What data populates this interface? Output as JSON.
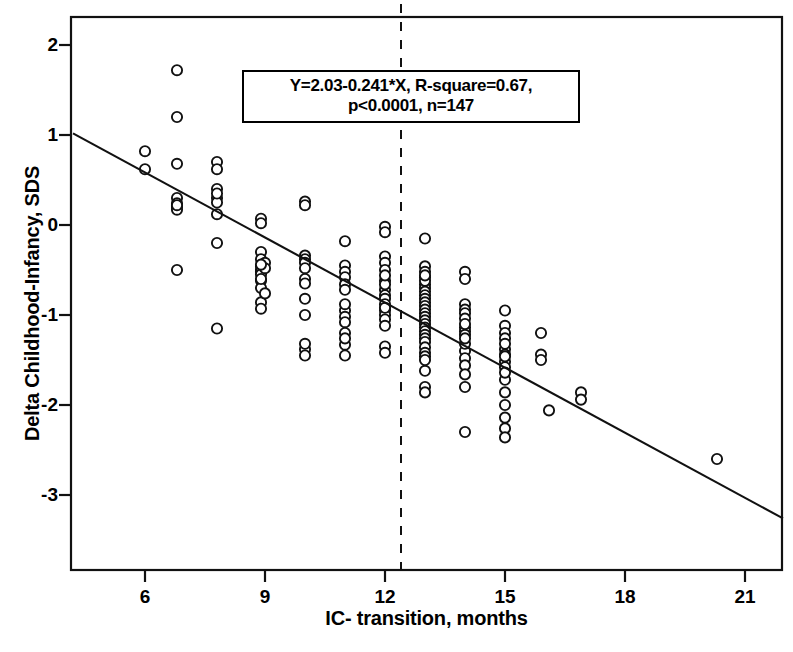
{
  "chart_data": {
    "type": "scatter",
    "title": "",
    "xlabel": "IC- transition, months",
    "ylabel": "Delta Childhood-Infancy, SDS",
    "xlim": [
      4.2,
      21.95
    ],
    "ylim": [
      -3.3,
      2.3
    ],
    "xticks": [
      6,
      9,
      12,
      15,
      18,
      21
    ],
    "yticks": [
      2,
      1,
      0,
      -1,
      -2,
      -3
    ],
    "grid": false,
    "legend": null,
    "marker": "open-circle",
    "annotation": {
      "line1": "Y=2.03-0.241*X,  R-square=0.67,",
      "line2": "p<0.0001, n=147"
    },
    "fit": {
      "equation": "Y=2.03-0.241*X",
      "slope": -0.241,
      "intercept": 2.03,
      "r_square": 0.67,
      "p_value": "p<0.0001",
      "n": 147,
      "x_start": 4.2,
      "x_end": 21.95
    },
    "vline": {
      "x": 12.4,
      "style": "dashed"
    },
    "points": [
      [
        6.0,
        0.82
      ],
      [
        6.0,
        0.62
      ],
      [
        6.8,
        1.72
      ],
      [
        6.8,
        1.2
      ],
      [
        6.8,
        0.68
      ],
      [
        6.8,
        0.3
      ],
      [
        6.8,
        0.24
      ],
      [
        6.8,
        0.2
      ],
      [
        6.8,
        0.17
      ],
      [
        6.8,
        -0.5
      ],
      [
        7.8,
        0.7
      ],
      [
        7.8,
        0.62
      ],
      [
        7.8,
        0.4
      ],
      [
        7.8,
        0.3
      ],
      [
        7.8,
        0.25
      ],
      [
        7.8,
        0.12
      ],
      [
        7.8,
        -0.2
      ],
      [
        7.8,
        -1.15
      ],
      [
        8.9,
        0.07
      ],
      [
        8.9,
        0.02
      ],
      [
        8.9,
        -0.3
      ],
      [
        8.9,
        -0.38
      ],
      [
        8.9,
        -0.46
      ],
      [
        8.9,
        -0.5
      ],
      [
        8.9,
        -0.52
      ],
      [
        8.9,
        -0.55
      ],
      [
        8.9,
        -0.62
      ],
      [
        8.9,
        -0.7
      ],
      [
        8.9,
        -0.86
      ],
      [
        8.9,
        -0.93
      ],
      [
        10.0,
        0.26
      ],
      [
        10.0,
        0.22
      ],
      [
        10.0,
        -0.34
      ],
      [
        10.0,
        -0.38
      ],
      [
        10.0,
        -0.42
      ],
      [
        10.0,
        -0.6
      ],
      [
        10.0,
        -0.65
      ],
      [
        10.0,
        -0.82
      ],
      [
        10.0,
        -1.0
      ],
      [
        10.0,
        -1.38
      ],
      [
        10.0,
        -1.45
      ],
      [
        11.0,
        -0.18
      ],
      [
        11.0,
        -0.45
      ],
      [
        11.0,
        -0.52
      ],
      [
        11.0,
        -0.58
      ],
      [
        11.0,
        -0.66
      ],
      [
        11.0,
        -0.72
      ],
      [
        11.0,
        -0.95
      ],
      [
        11.0,
        -1.02
      ],
      [
        11.0,
        -1.08
      ],
      [
        11.0,
        -1.2
      ],
      [
        11.0,
        -1.33
      ],
      [
        11.0,
        -1.45
      ],
      [
        12.0,
        -0.02
      ],
      [
        12.0,
        -0.08
      ],
      [
        12.0,
        -0.35
      ],
      [
        12.0,
        -0.42
      ],
      [
        12.0,
        -0.5
      ],
      [
        12.0,
        -0.62
      ],
      [
        12.0,
        -0.72
      ],
      [
        12.0,
        -0.78
      ],
      [
        12.0,
        -0.82
      ],
      [
        12.0,
        -0.88
      ],
      [
        12.0,
        -0.95
      ],
      [
        12.0,
        -1.0
      ],
      [
        12.0,
        -1.05
      ],
      [
        12.0,
        -1.35
      ],
      [
        12.0,
        -1.42
      ],
      [
        13.0,
        -0.15
      ],
      [
        13.0,
        -0.46
      ],
      [
        13.0,
        -0.52
      ],
      [
        13.0,
        -0.58
      ],
      [
        13.0,
        -0.66
      ],
      [
        13.0,
        -0.7
      ],
      [
        13.0,
        -0.74
      ],
      [
        13.0,
        -0.78
      ],
      [
        13.0,
        -0.82
      ],
      [
        13.0,
        -0.86
      ],
      [
        13.0,
        -0.9
      ],
      [
        13.0,
        -0.94
      ],
      [
        13.0,
        -0.98
      ],
      [
        13.0,
        -1.02
      ],
      [
        13.0,
        -1.06
      ],
      [
        13.0,
        -1.1
      ],
      [
        13.0,
        -1.14
      ],
      [
        13.0,
        -1.18
      ],
      [
        13.0,
        -1.22
      ],
      [
        13.0,
        -1.26
      ],
      [
        13.0,
        -1.3
      ],
      [
        13.0,
        -1.36
      ],
      [
        13.0,
        -1.42
      ],
      [
        13.0,
        -1.62
      ],
      [
        13.0,
        -1.8
      ],
      [
        13.0,
        -1.86
      ],
      [
        14.0,
        -0.52
      ],
      [
        14.0,
        -0.6
      ],
      [
        14.0,
        -0.88
      ],
      [
        14.0,
        -0.94
      ],
      [
        14.0,
        -0.98
      ],
      [
        14.0,
        -1.04
      ],
      [
        14.0,
        -1.14
      ],
      [
        14.0,
        -1.18
      ],
      [
        14.0,
        -1.22
      ],
      [
        14.0,
        -1.4
      ],
      [
        14.0,
        -1.48
      ],
      [
        14.0,
        -1.56
      ],
      [
        14.0,
        -1.66
      ],
      [
        14.0,
        -1.8
      ],
      [
        14.0,
        -2.3
      ],
      [
        15.0,
        -0.95
      ],
      [
        15.0,
        -1.12
      ],
      [
        15.0,
        -1.2
      ],
      [
        15.0,
        -1.26
      ],
      [
        15.0,
        -1.38
      ],
      [
        15.0,
        -1.44
      ],
      [
        15.0,
        -1.52
      ],
      [
        15.0,
        -1.58
      ],
      [
        15.0,
        -1.72
      ],
      [
        15.0,
        -1.86
      ],
      [
        15.0,
        -2.0
      ],
      [
        15.0,
        -2.14
      ],
      [
        15.0,
        -2.26
      ],
      [
        15.0,
        -2.36
      ],
      [
        15.9,
        -1.2
      ],
      [
        15.9,
        -1.44
      ],
      [
        15.9,
        -1.5
      ],
      [
        16.1,
        -2.06
      ],
      [
        16.9,
        -1.86
      ],
      [
        16.9,
        -1.94
      ],
      [
        20.3,
        -2.6
      ],
      [
        9.0,
        -0.42
      ],
      [
        9.0,
        -0.48
      ],
      [
        9.0,
        -0.76
      ],
      [
        11.0,
        -0.88
      ],
      [
        11.0,
        -1.26
      ],
      [
        12.0,
        -0.66
      ],
      [
        12.0,
        -1.12
      ],
      [
        13.0,
        -0.62
      ],
      [
        13.0,
        -1.46
      ],
      [
        14.0,
        -1.32
      ],
      [
        14.0,
        -1.1
      ],
      [
        15.0,
        -1.32
      ],
      [
        15.0,
        -1.64
      ],
      [
        10.0,
        -0.48
      ],
      [
        10.0,
        -1.32
      ],
      [
        12.0,
        -0.56
      ],
      [
        12.0,
        -0.92
      ],
      [
        13.0,
        -1.5
      ],
      [
        13.0,
        -0.56
      ],
      [
        8.9,
        -0.6
      ],
      [
        8.9,
        -0.44
      ],
      [
        7.8,
        0.35
      ],
      [
        6.8,
        0.22
      ],
      [
        14.0,
        -1.26
      ],
      [
        15.0,
        -1.46
      ]
    ]
  }
}
